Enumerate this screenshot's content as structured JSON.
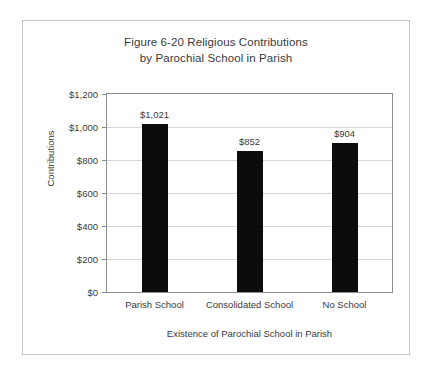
{
  "figure": {
    "title_lines": [
      "Figure 6-20 Religious Contributions",
      "by Parochial School in Parish"
    ],
    "frame_border_color": "#c9c9c9",
    "background_color": "#ffffff"
  },
  "chart_data": {
    "type": "bar",
    "title": "Figure 6-20 Religious Contributions by Parochial School in Parish",
    "categories": [
      "Parish School",
      "Consolidated School",
      "No School"
    ],
    "values": [
      1021,
      852,
      904
    ],
    "value_labels": [
      "$1,021",
      "$852",
      "$904"
    ],
    "xlabel": "Existence of Parochial School in Parish",
    "ylabel": "Contributions",
    "ylim": [
      0,
      1200
    ],
    "ytick_values": [
      0,
      200,
      400,
      600,
      800,
      1000,
      1200
    ],
    "ytick_labels": [
      "$0",
      "$200",
      "$400",
      "$600",
      "$800",
      "$1,000",
      "$1,200"
    ],
    "grid": true,
    "grid_axis": "y",
    "legend": null,
    "bar_color": "#0c0c0c",
    "gridline_color": "#d6d6d6",
    "axis_color": "#8c8c8c"
  }
}
